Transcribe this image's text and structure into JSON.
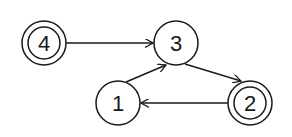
{
  "diagram": {
    "type": "state-diagram",
    "colors": {
      "stroke": "#1a1a1a",
      "background": "#ffffff"
    },
    "nodes": [
      {
        "id": "4",
        "label": "4",
        "cx": 44,
        "cy": 43,
        "r": 22,
        "double": true
      },
      {
        "id": "3",
        "label": "3",
        "cx": 176,
        "cy": 43,
        "r": 22,
        "double": false
      },
      {
        "id": "1",
        "label": "1",
        "cx": 118,
        "cy": 103,
        "r": 22,
        "double": false
      },
      {
        "id": "2",
        "label": "2",
        "cx": 250,
        "cy": 103,
        "r": 22,
        "double": true
      }
    ],
    "edges": [
      {
        "from": "4",
        "to": "3"
      },
      {
        "from": "1",
        "to": "3"
      },
      {
        "from": "3",
        "to": "2"
      },
      {
        "from": "2",
        "to": "1"
      }
    ]
  }
}
